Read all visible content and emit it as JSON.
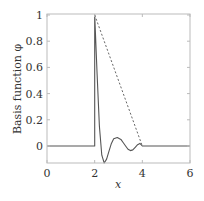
{
  "chart_data": {
    "type": "line",
    "title": "",
    "xlabel": "x",
    "ylabel": "Basis function φ",
    "xlim": [
      0,
      6
    ],
    "ylim": [
      -0.13,
      1
    ],
    "xticks": [
      0,
      2,
      4,
      6
    ],
    "xtick_labels": [
      "0",
      "2",
      "4",
      "6"
    ],
    "yticks": [
      0,
      0.2,
      0.4,
      0.6,
      0.8,
      1
    ],
    "ytick_labels": [
      "0",
      "0.2",
      "0.4",
      "0.6",
      "0.8",
      "1"
    ],
    "grid": false,
    "legend": null,
    "series": [
      {
        "name": "basis function (solid)",
        "style": "solid",
        "color": "#555555",
        "x": [
          0,
          2,
          2,
          2.1,
          2.2,
          2.3,
          2.4,
          2.5,
          2.6,
          2.7,
          2.8,
          2.95,
          3.1,
          3.2,
          3.3,
          3.4,
          3.5,
          3.6,
          3.7,
          3.8,
          3.9,
          4.0,
          6
        ],
        "y": [
          0,
          0,
          1,
          0.55,
          0.15,
          -0.07,
          -0.13,
          -0.1,
          -0.04,
          0.02,
          0.055,
          0.065,
          0.05,
          0.025,
          0.0,
          -0.025,
          -0.035,
          -0.03,
          -0.01,
          0.01,
          0.02,
          0,
          0
        ]
      },
      {
        "name": "linear hat (dashed)",
        "style": "dashed",
        "color": "#555555",
        "x": [
          2,
          4
        ],
        "y": [
          1,
          0
        ]
      }
    ]
  },
  "colors": {
    "frame": "#bbbbbb",
    "line": "#555555",
    "text": "#333333"
  }
}
